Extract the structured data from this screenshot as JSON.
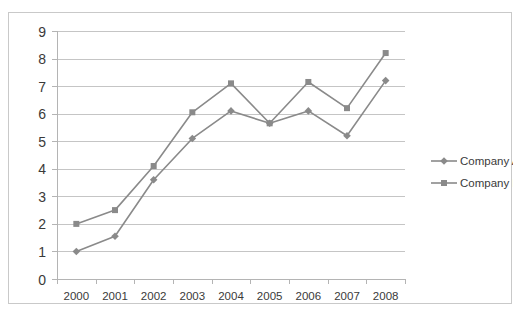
{
  "chart_data": {
    "type": "line",
    "title": "",
    "subtitle": "",
    "xlabel": "",
    "ylabel": "",
    "categories": [
      "2000",
      "2001",
      "2002",
      "2003",
      "2004",
      "2005",
      "2006",
      "2007",
      "2008"
    ],
    "series": [
      {
        "name": "Company A",
        "marker": "diamond",
        "color": "#8a8a8a",
        "values": [
          1.0,
          1.55,
          3.6,
          5.1,
          6.1,
          5.65,
          6.1,
          5.2,
          7.2
        ]
      },
      {
        "name": "Company B",
        "marker": "square",
        "color": "#8a8a8a",
        "values": [
          2.0,
          2.5,
          4.1,
          6.05,
          7.1,
          5.65,
          7.15,
          6.2,
          8.2
        ]
      }
    ],
    "ylim": [
      0,
      9
    ],
    "yticks": [
      0,
      1,
      2,
      3,
      4,
      5,
      6,
      7,
      8,
      9
    ],
    "ytick_labels": [
      "0",
      "1",
      "2",
      "3",
      "4",
      "5",
      "6",
      "7",
      "8",
      "9"
    ],
    "xlim": [
      0,
      8
    ],
    "grid": "horizontal",
    "legend_position": "right",
    "legend_entries": [
      "Company A",
      "Company B"
    ],
    "plot_background": "#ffffff",
    "grid_color": "#c5c5c5",
    "axis_color": "#b4b4b4",
    "text_color": "#3a3a3a",
    "border_color": "#c9c9c9"
  }
}
